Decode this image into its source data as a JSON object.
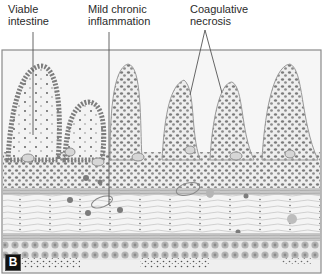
{
  "figure": {
    "panel_label": "B",
    "labels": [
      {
        "id": "viable",
        "text_lines": [
          "Viable",
          "intestine"
        ],
        "x": 8,
        "y": 3
      },
      {
        "id": "mild",
        "text_lines": [
          "Mild chronic",
          "inflammation"
        ],
        "x": 88,
        "y": 3
      },
      {
        "id": "necrosis",
        "text_lines": [
          "Coagulative",
          "necrosis"
        ],
        "x": 190,
        "y": 3
      }
    ],
    "colors": {
      "frame": "#8a8a8a",
      "epithelium": "#7d7d7d",
      "nucleus": "#6e6e6e",
      "tissue_bg": "#f2f2f2",
      "muscle": "#b9b9b9",
      "pointer": "#555555"
    }
  }
}
